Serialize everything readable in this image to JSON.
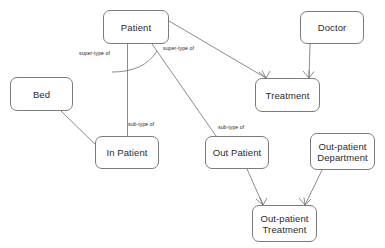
{
  "diagram": {
    "background_color": "#ffffff",
    "line_color": "#6f6f6f",
    "text_color": "#2b2b2b",
    "nodes": [
      {
        "id": "patient",
        "label": "Patient",
        "x": 103,
        "y": 10,
        "w": 66,
        "h": 34
      },
      {
        "id": "doctor",
        "label": "Doctor",
        "x": 300,
        "y": 11,
        "w": 64,
        "h": 33
      },
      {
        "id": "treatment",
        "label": "Treatment",
        "x": 255,
        "y": 78,
        "w": 65,
        "h": 34
      },
      {
        "id": "bed",
        "label": "Bed",
        "x": 10,
        "y": 77,
        "w": 63,
        "h": 34
      },
      {
        "id": "in-patient",
        "label": "In Patient",
        "x": 95,
        "y": 136,
        "w": 64,
        "h": 33
      },
      {
        "id": "out-patient",
        "label": "Out Patient",
        "x": 205,
        "y": 136,
        "w": 64,
        "h": 33
      },
      {
        "id": "out-patient-department",
        "label": "Out-patient\nDepartment",
        "x": 310,
        "y": 133,
        "w": 65,
        "h": 37
      },
      {
        "id": "out-patient-treatment",
        "label": "Out-patient\nTreatment",
        "x": 252,
        "y": 205,
        "w": 65,
        "h": 37
      }
    ],
    "edge_labels": [
      {
        "id": "super-type-of-1",
        "text": "super-type of",
        "x": 79,
        "y": 50
      },
      {
        "id": "super-type-of-2",
        "text": "super-type of",
        "x": 163,
        "y": 45
      },
      {
        "id": "sub-type-of-1",
        "text": "sub-type of",
        "x": 128,
        "y": 121
      },
      {
        "id": "sub-type-of-2",
        "text": "sub-type of",
        "x": 218,
        "y": 124
      }
    ],
    "edges": [
      {
        "id": "patient-to-in-patient",
        "from": "patient",
        "to": "in-patient",
        "kind": "generalization"
      },
      {
        "id": "patient-to-out-patient",
        "from": "patient",
        "to": "out-patient",
        "kind": "generalization"
      },
      {
        "id": "patient-to-treatment",
        "from": "patient",
        "to": "treatment",
        "kind": "crowsfoot-many"
      },
      {
        "id": "doctor-to-treatment",
        "from": "doctor",
        "to": "treatment",
        "kind": "crowsfoot-many"
      },
      {
        "id": "bed-to-in-patient",
        "from": "bed",
        "to": "in-patient",
        "kind": "plain"
      },
      {
        "id": "out-patient-to-out-patient-treatment",
        "from": "out-patient",
        "to": "out-patient-treatment",
        "kind": "crowsfoot-many"
      },
      {
        "id": "out-patient-department-to-out-patient-treatment",
        "from": "out-patient-department",
        "to": "out-patient-treatment",
        "kind": "crowsfoot-many"
      }
    ]
  }
}
